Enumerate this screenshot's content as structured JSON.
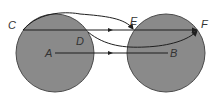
{
  "diagram": {
    "labels": {
      "A": "A",
      "B": "B",
      "C": "C",
      "D": "D",
      "E": "E",
      "F": "F"
    },
    "colors": {
      "background": "#ffffff",
      "circle_fill": "#8a8a8a",
      "circle_stroke": "#4a4a4a",
      "line": "#1f1f1f"
    },
    "circles": [
      {
        "id": "left",
        "cx": 55,
        "cy": 53,
        "r": 39
      },
      {
        "id": "right",
        "cx": 166,
        "cy": 53,
        "r": 39
      }
    ]
  }
}
